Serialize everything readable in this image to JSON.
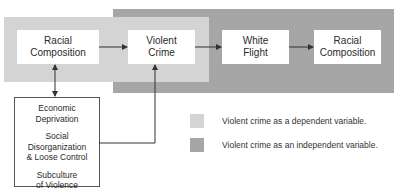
{
  "diagram": {
    "nodes": {
      "racial_composition_left": [
        "Racial",
        "Composition"
      ],
      "violent_crime": [
        "Violent",
        "Crime"
      ],
      "white_flight": [
        "White",
        "Flight"
      ],
      "racial_composition_right": [
        "Racial",
        "Composition"
      ]
    },
    "factors": [
      [
        "Economic",
        "Deprivation"
      ],
      [
        "Social Disorganization",
        "& Loose Control"
      ],
      [
        "Subculture",
        "of Violence"
      ]
    ],
    "legend": [
      {
        "label": "Violent crime as a dependent variable.",
        "color": "#d4d4d4"
      },
      {
        "label": "Violent crime as an independent variable.",
        "color": "#a6a6a6"
      }
    ]
  }
}
